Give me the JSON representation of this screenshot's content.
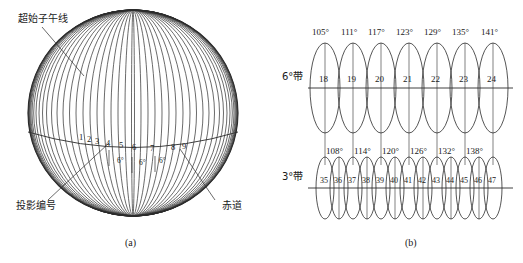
{
  "figure": {
    "width": 523,
    "height": 263,
    "background": "#ffffff",
    "stroke_color": "#2b2b2b"
  },
  "panel_a": {
    "caption": "(a)",
    "labels": {
      "prime_meridian": "超始子午线",
      "projection_number": "投影编号",
      "equator": "赤道"
    },
    "zone_numbers": [
      "1",
      "2",
      "3",
      "4",
      "5",
      "6",
      "7",
      "8",
      "9"
    ],
    "span_labels": [
      "6°",
      "6°",
      "6°"
    ]
  },
  "panel_b": {
    "caption": "(b)",
    "band6": {
      "label": "6°带",
      "degrees": [
        "105°",
        "111°",
        "117°",
        "123°",
        "129°",
        "135°",
        "141°"
      ],
      "zones": [
        "18",
        "19",
        "20",
        "21",
        "22",
        "23",
        "24"
      ]
    },
    "band3": {
      "label": "3°带",
      "degrees": [
        "108°",
        "114°",
        "120°",
        "126°",
        "132°",
        "138°"
      ],
      "zones": [
        "35",
        "36",
        "37",
        "38",
        "39",
        "40",
        "41",
        "42",
        "43",
        "44",
        "45",
        "46",
        "47"
      ]
    }
  }
}
